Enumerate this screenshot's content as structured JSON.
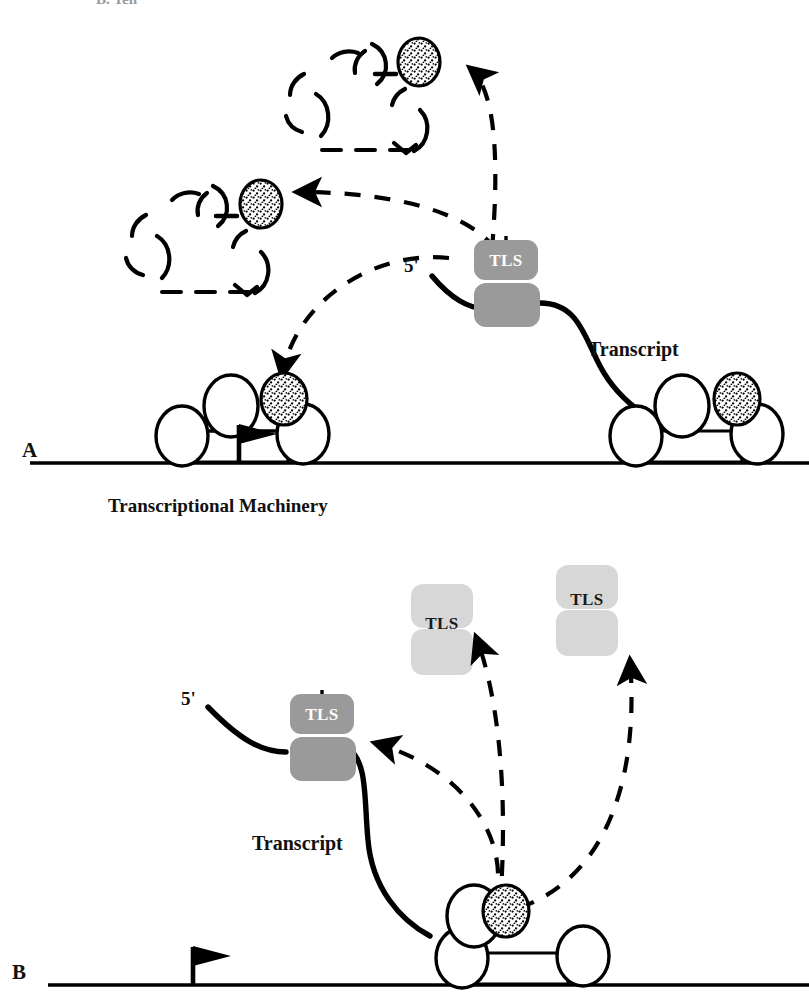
{
  "figure": {
    "page_header_fragment": "B. Yen",
    "background_color": "#ffffff",
    "ink_color": "#000000",
    "panels": [
      {
        "id": "A",
        "letter": "A",
        "letter_x": 22,
        "letter_y": 440,
        "dna_line": {
          "x1": 30,
          "y1": 463,
          "x2": 809,
          "y2": 463
        },
        "caption": "Transcriptional Machinery",
        "caption_x": 108,
        "caption_y": 496,
        "prime_label": "5'",
        "prime_x": 404,
        "prime_y": 256,
        "transcript_label": "Transcript",
        "transcript_x": 588,
        "transcript_y": 339
      },
      {
        "id": "B",
        "letter": "B",
        "letter_x": 12,
        "letter_y": 962,
        "dna_line": {
          "x1": 48,
          "y1": 985,
          "x2": 809,
          "y2": 985
        },
        "prime_label": "5'",
        "prime_x": 181,
        "prime_y": 689,
        "transcript_label": "Transcript",
        "transcript_x": 252,
        "transcript_y": 833
      }
    ],
    "tls_label": "TLS",
    "colors": {
      "tls_bound_fill": "#9a9a9a",
      "tls_bound_text": "#ffffff",
      "tls_free_fill": "#d7d7d7",
      "tls_free_text": "#1a1a1a",
      "stipple_fill": "#ffffff",
      "stipple_dots": "#000000",
      "subunit_fill": "#ffffff",
      "stroke": "#000000"
    },
    "elements": {
      "tls_complexes": [
        {
          "id": "tls-bound-a",
          "panel": "A",
          "state": "bound",
          "x": 470,
          "y": 240
        },
        {
          "id": "tls-bound-b",
          "panel": "B",
          "state": "bound",
          "x": 288,
          "y": 695
        },
        {
          "id": "tls-free-b-left",
          "panel": "B",
          "state": "free",
          "x": 416,
          "y": 570
        },
        {
          "id": "tls-free-b-right",
          "panel": "B",
          "state": "free",
          "x": 560,
          "y": 560
        }
      ],
      "dashed_complexes": [
        {
          "id": "dashed-complex-top",
          "panel": "A",
          "x": 262,
          "y": 40
        },
        {
          "id": "dashed-complex-left",
          "panel": "A",
          "x": 110,
          "y": 178
        }
      ],
      "transcription_complexes": [
        {
          "id": "txn-complex-a-left",
          "panel": "A",
          "x": 155,
          "y": 383,
          "has_promoter_flag": true
        },
        {
          "id": "txn-complex-a-right",
          "panel": "A",
          "x": 608,
          "y": 383,
          "has_promoter_flag": false
        },
        {
          "id": "txn-complex-b",
          "panel": "B",
          "x": 430,
          "y": 890,
          "has_promoter_flag": true
        }
      ],
      "arrows": [
        {
          "id": "arrow-a-to-top-complex",
          "panel": "A",
          "style": "dashed",
          "from": "tls-bound-a",
          "to": "dashed-complex-top"
        },
        {
          "id": "arrow-a-to-left-complex",
          "panel": "A",
          "style": "dashed",
          "from": "tls-bound-a",
          "to": "dashed-complex-left"
        },
        {
          "id": "arrow-a-to-txn-stipple",
          "panel": "A",
          "style": "dashed",
          "from": "tls-bound-a",
          "to": "txn-complex-a-left"
        },
        {
          "id": "arrow-b-stipple-to-tls-bound",
          "panel": "B",
          "style": "dashed",
          "from": "txn-complex-b",
          "to": "tls-bound-b"
        },
        {
          "id": "arrow-b-stipple-to-tls-free-left",
          "panel": "B",
          "style": "dashed",
          "from": "txn-complex-b",
          "to": "tls-free-b-left"
        },
        {
          "id": "arrow-b-stipple-to-tls-free-right",
          "panel": "B",
          "style": "dashed",
          "from": "txn-complex-b",
          "to": "tls-free-b-right"
        }
      ]
    }
  }
}
